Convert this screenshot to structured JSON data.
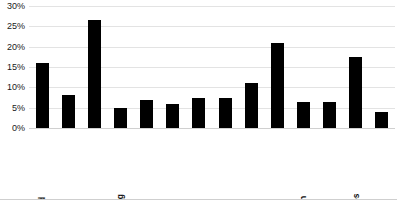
{
  "chart_data": {
    "type": "bar",
    "title": "",
    "subtitle": "",
    "xlabel": "",
    "ylabel": "",
    "ylim": [
      0,
      30
    ],
    "ytick_step": 5,
    "grid": true,
    "legend": false,
    "bar_color": "#000000",
    "categories": [
      "Agri & related",
      "Mining",
      "Construction",
      "Manufacturing",
      "Wholesale",
      "Retail",
      "Trans &\nutilities",
      "Information",
      "Financial",
      "Prof & bus\nservices",
      "Educ & health",
      "Leisure &\nhospitality",
      "Other services",
      "Public admin"
    ],
    "values": [
      16,
      8,
      26.5,
      5,
      7,
      6,
      7.5,
      7.5,
      11,
      21,
      6.5,
      6.5,
      17.5,
      4
    ],
    "ytick_labels": [
      "0%",
      "5%",
      "10%",
      "15%",
      "20%",
      "25%",
      "30%"
    ],
    "ytick_values": [
      0,
      5,
      10,
      15,
      20,
      25,
      30
    ]
  },
  "axis": {
    "y_ticks": [
      {
        "label": "30%",
        "value": 30
      },
      {
        "label": "25%",
        "value": 25
      },
      {
        "label": "20%",
        "value": 20
      },
      {
        "label": "15%",
        "value": 15
      },
      {
        "label": "10%",
        "value": 10
      },
      {
        "label": "5%",
        "value": 5
      },
      {
        "label": "0%",
        "value": 0
      }
    ]
  }
}
